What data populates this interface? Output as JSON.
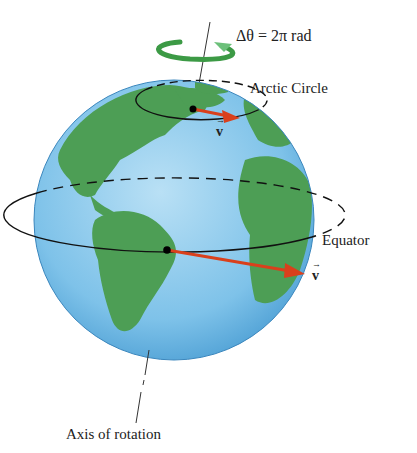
{
  "diagram": {
    "labels": {
      "rotation": "Δθ = 2π rad",
      "arctic_circle": "Arctic Circle",
      "equator": "Equator",
      "velocity_arctic": "v",
      "velocity_equator": "v",
      "axis": "Axis of rotation"
    },
    "colors": {
      "ocean": "#7cc0e8",
      "land": "#4d9e55",
      "velocity_arrow": "#d9401c",
      "rotation_arrow": "#3c9a45",
      "lines": "#111111"
    }
  }
}
